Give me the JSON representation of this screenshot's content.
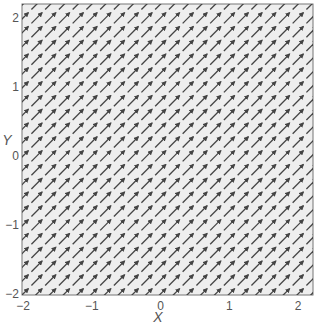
{
  "chart_data": {
    "type": "quiver",
    "title": "",
    "xlabel": "X",
    "ylabel": "Y",
    "xlim": [
      -2,
      2.2
    ],
    "ylim": [
      -2,
      2.2
    ],
    "xticks": [
      -2,
      -1,
      0,
      1,
      2
    ],
    "yticks": [
      -2,
      -1,
      0,
      1,
      2
    ],
    "xtick_labels": [
      "−2",
      "−1",
      "0",
      "1",
      "2"
    ],
    "ytick_labels": [
      "−2",
      "−1",
      "0",
      "1",
      "2"
    ],
    "grid": {
      "x_start": -2,
      "x_end": 2.2,
      "y_start": -2,
      "y_end": 2.2,
      "step": 0.2
    },
    "vector": {
      "u": 1,
      "v": 1,
      "description": "uniform field, all arrows point toward upper-right at 45 degrees"
    },
    "arrow_length_units": 0.22,
    "colors": {
      "background": "#eeeeee",
      "arrow": "#444444",
      "frame": "#777777",
      "text": "#555555"
    }
  }
}
